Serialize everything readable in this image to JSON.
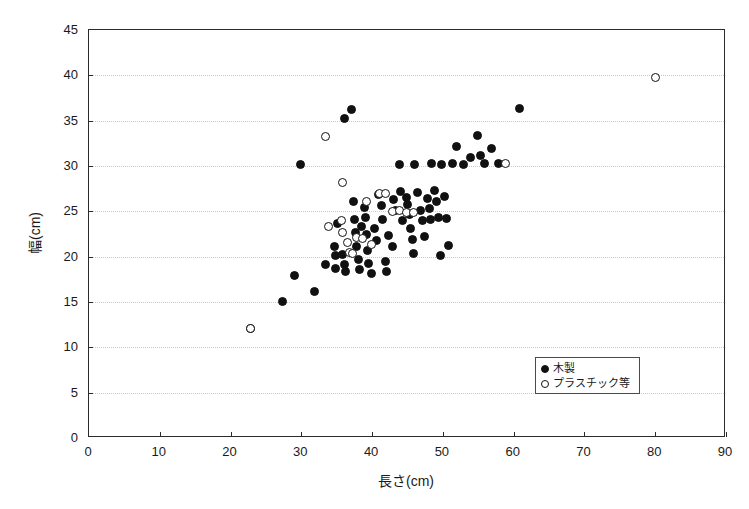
{
  "chart_data": {
    "type": "scatter",
    "title": "",
    "xlabel": "長さ(cm)",
    "ylabel": "幅(cm)",
    "xlim": [
      0,
      90
    ],
    "ylim": [
      0,
      45
    ],
    "xticks": [
      0,
      10,
      20,
      30,
      40,
      50,
      60,
      70,
      80,
      90
    ],
    "yticks": [
      0,
      5,
      10,
      15,
      20,
      25,
      30,
      35,
      40,
      45
    ],
    "xtick_labels": [
      "0",
      "10",
      "20",
      "30",
      "40",
      "50",
      "60",
      "70",
      "80",
      "90"
    ],
    "ytick_labels": [
      "0",
      "5",
      "10",
      "15",
      "20",
      "25",
      "30",
      "35",
      "40",
      "45"
    ],
    "grid": "horizontal-dotted",
    "legend_position": "lower-right",
    "series": [
      {
        "name": "木製",
        "marker": "filled-circle",
        "color": "#111111",
        "points": [
          [
            23.0,
            12.0
          ],
          [
            27.5,
            15.0
          ],
          [
            29.2,
            17.8
          ],
          [
            30.0,
            30.1
          ],
          [
            32.0,
            16.1
          ],
          [
            33.5,
            19.0
          ],
          [
            34.8,
            21.0
          ],
          [
            35.0,
            20.0
          ],
          [
            35.0,
            18.6
          ],
          [
            35.3,
            23.5
          ],
          [
            36.0,
            20.1
          ],
          [
            36.2,
            19.0
          ],
          [
            36.3,
            35.1
          ],
          [
            36.4,
            18.2
          ],
          [
            37.2,
            36.1
          ],
          [
            37.5,
            26.0
          ],
          [
            37.6,
            24.0
          ],
          [
            37.8,
            22.6
          ],
          [
            38.0,
            21.0
          ],
          [
            38.2,
            19.6
          ],
          [
            38.4,
            18.5
          ],
          [
            38.6,
            23.2
          ],
          [
            39.0,
            25.3
          ],
          [
            39.2,
            24.2
          ],
          [
            39.4,
            22.3
          ],
          [
            39.5,
            20.6
          ],
          [
            39.6,
            19.1
          ],
          [
            40.0,
            18.0
          ],
          [
            40.5,
            23.0
          ],
          [
            40.8,
            21.7
          ],
          [
            41.0,
            26.8
          ],
          [
            41.4,
            25.5
          ],
          [
            41.6,
            24.0
          ],
          [
            42.0,
            19.4
          ],
          [
            42.2,
            18.3
          ],
          [
            42.5,
            22.2
          ],
          [
            43.0,
            21.0
          ],
          [
            43.2,
            26.2
          ],
          [
            43.5,
            25.0
          ],
          [
            44.0,
            30.1
          ],
          [
            44.2,
            27.1
          ],
          [
            44.5,
            23.9
          ],
          [
            45.0,
            26.4
          ],
          [
            45.2,
            25.6
          ],
          [
            45.4,
            24.5
          ],
          [
            45.6,
            23.0
          ],
          [
            45.8,
            21.8
          ],
          [
            46.0,
            20.2
          ],
          [
            46.2,
            30.1
          ],
          [
            46.5,
            27.0
          ],
          [
            47.0,
            25.0
          ],
          [
            47.2,
            23.9
          ],
          [
            47.5,
            22.1
          ],
          [
            48.0,
            26.3
          ],
          [
            48.2,
            25.2
          ],
          [
            48.4,
            24.0
          ],
          [
            48.6,
            30.2
          ],
          [
            49.0,
            27.2
          ],
          [
            49.3,
            26.0
          ],
          [
            49.5,
            24.2
          ],
          [
            49.8,
            20.0
          ],
          [
            50.0,
            30.1
          ],
          [
            50.3,
            26.5
          ],
          [
            50.6,
            24.1
          ],
          [
            51.0,
            21.1
          ],
          [
            51.5,
            30.2
          ],
          [
            52.0,
            32.0
          ],
          [
            53.0,
            30.1
          ],
          [
            54.0,
            30.8
          ],
          [
            55.0,
            33.2
          ],
          [
            55.5,
            31.0
          ],
          [
            56.0,
            30.2
          ],
          [
            57.0,
            31.8
          ],
          [
            58.0,
            30.2
          ],
          [
            61.0,
            36.2
          ]
        ]
      },
      {
        "name": "プラスチック等",
        "marker": "open-circle",
        "color": "#111111",
        "points": [
          [
            23.0,
            12.0
          ],
          [
            33.5,
            33.1
          ],
          [
            34.0,
            23.2
          ],
          [
            35.8,
            23.9
          ],
          [
            35.9,
            22.6
          ],
          [
            36.0,
            28.1
          ],
          [
            36.6,
            21.4
          ],
          [
            37.0,
            20.3
          ],
          [
            37.4,
            20.2
          ],
          [
            38.0,
            22.0
          ],
          [
            38.8,
            21.9
          ],
          [
            39.4,
            26.0
          ],
          [
            40.0,
            21.2
          ],
          [
            41.2,
            26.9
          ],
          [
            42.0,
            26.9
          ],
          [
            43.0,
            24.9
          ],
          [
            44.0,
            25.0
          ],
          [
            45.0,
            24.8
          ],
          [
            46.0,
            24.8
          ],
          [
            59.0,
            30.2
          ],
          [
            80.2,
            39.7
          ]
        ]
      }
    ]
  },
  "legend": {
    "items": [
      {
        "label": "木製",
        "marker": "filled-circle"
      },
      {
        "label": "プラスチック等",
        "marker": "open-circle"
      }
    ]
  }
}
